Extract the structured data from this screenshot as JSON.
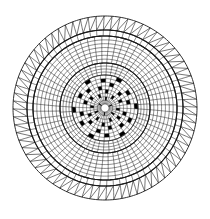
{
  "figure": {
    "name": "radial-mesh-mandala",
    "kind": "polar-grid-diagram",
    "caption": "",
    "canvas": {
      "width": 210,
      "height": 219
    },
    "background_color": "#ffffff",
    "stroke_color": "#1a1a1a",
    "fill_color": "#000000",
    "center": {
      "x": 105,
      "y": 108
    },
    "outer_radius": 92,
    "bands": [
      {
        "name": "outer-zigzag-band",
        "r_inner": 78,
        "r_outer": 92,
        "sectors": 72,
        "rings": 1,
        "style": "zigzag",
        "stroke_width": 0.6,
        "boundary_stroke_width": 0.9
      },
      {
        "name": "outer-quad-band",
        "r_inner": 72,
        "r_outer": 78,
        "sectors": 72,
        "rings": 1,
        "style": "quad",
        "stroke_width": 0.55,
        "boundary_stroke_width": 1.1
      },
      {
        "name": "upper-mid-band",
        "r_inner": 45,
        "r_outer": 72,
        "sectors": 60,
        "rings": 7,
        "style": "quad",
        "stroke_width": 0.5,
        "boundary_stroke_width": 1.1
      },
      {
        "name": "lower-mid-band",
        "r_inner": 33,
        "r_outer": 45,
        "sectors": 48,
        "rings": 4,
        "style": "quad",
        "stroke_width": 0.5,
        "boundary_stroke_width": 0.9
      },
      {
        "name": "inner-core-band",
        "r_inner": 4,
        "r_outer": 33,
        "sectors": 36,
        "rings": 8,
        "style": "quad",
        "stroke_width": 0.45,
        "boundary_stroke_width": 0.5
      }
    ],
    "spiral_twist_deg": 4.5,
    "filled_cells": {
      "band": "inner-core-band",
      "note": "ring index counted outward from r_inner; sector index counted clockwise from 12 o'clock",
      "cells": [
        {
          "ring": 7,
          "sector": 2
        },
        {
          "ring": 7,
          "sector": 8
        },
        {
          "ring": 7,
          "sector": 14
        },
        {
          "ring": 7,
          "sector": 20
        },
        {
          "ring": 7,
          "sector": 26
        },
        {
          "ring": 7,
          "sector": 32
        },
        {
          "ring": 6,
          "sector": 5
        },
        {
          "ring": 6,
          "sector": 11
        },
        {
          "ring": 6,
          "sector": 17
        },
        {
          "ring": 6,
          "sector": 23
        },
        {
          "ring": 6,
          "sector": 29
        },
        {
          "ring": 6,
          "sector": 35
        },
        {
          "ring": 5,
          "sector": 1
        },
        {
          "ring": 5,
          "sector": 7
        },
        {
          "ring": 5,
          "sector": 13
        },
        {
          "ring": 5,
          "sector": 19
        },
        {
          "ring": 5,
          "sector": 25
        },
        {
          "ring": 5,
          "sector": 31
        },
        {
          "ring": 4,
          "sector": 4
        },
        {
          "ring": 4,
          "sector": 10
        },
        {
          "ring": 4,
          "sector": 16
        },
        {
          "ring": 4,
          "sector": 22
        },
        {
          "ring": 4,
          "sector": 28
        },
        {
          "ring": 4,
          "sector": 34
        },
        {
          "ring": 3,
          "sector": 0
        },
        {
          "ring": 3,
          "sector": 6
        },
        {
          "ring": 3,
          "sector": 12
        },
        {
          "ring": 3,
          "sector": 18
        },
        {
          "ring": 3,
          "sector": 24
        },
        {
          "ring": 3,
          "sector": 30
        },
        {
          "ring": 2,
          "sector": 3
        },
        {
          "ring": 2,
          "sector": 9
        },
        {
          "ring": 2,
          "sector": 15
        },
        {
          "ring": 2,
          "sector": 21
        },
        {
          "ring": 2,
          "sector": 27
        },
        {
          "ring": 2,
          "sector": 33
        },
        {
          "ring": 1,
          "sector": 0
        },
        {
          "ring": 1,
          "sector": 12
        },
        {
          "ring": 1,
          "sector": 24
        },
        {
          "ring": 0,
          "sector": 6
        },
        {
          "ring": 0,
          "sector": 18
        },
        {
          "ring": 0,
          "sector": 30
        }
      ]
    }
  }
}
